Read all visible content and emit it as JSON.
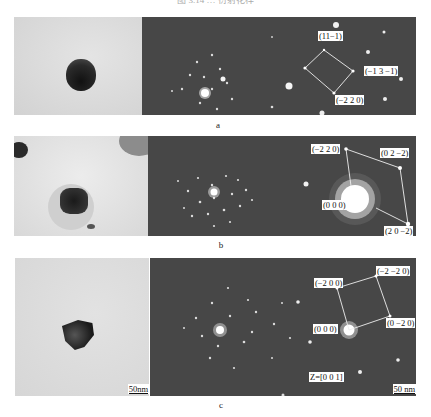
{
  "header": {
    "text": "图 3.14 … 衍射花样"
  },
  "panels": [
    {
      "caption": "a",
      "bright_field": {
        "particle": "rounded dark particle",
        "background": "#dcdcdc"
      },
      "diffraction": {
        "background": "#474747",
        "labels": [
          "(11−1)",
          "(−1 3 −1)",
          "(−2 2 0)"
        ]
      }
    },
    {
      "caption": "b",
      "bright_field": {
        "particle": "rectangular dark particle with halo",
        "background": "#e2e2e2"
      },
      "diffraction": {
        "background": "#474747",
        "labels": [
          "(−2 2 0)",
          "(0 2 −2)",
          "(0 0 0)",
          "(2 0 −2)"
        ]
      }
    },
    {
      "caption": "c",
      "bright_field": {
        "particle": "faceted dark particle",
        "background": "#dedede",
        "scale_bar": "50nm"
      },
      "diffraction": {
        "background": "#474747",
        "labels": [
          "(−2 0 0)",
          "(−2 −2 0)",
          "(0 0 0)",
          "(0 −2 0)"
        ],
        "zone_axis": "Z=[0 0 1]",
        "scale_bar": "50 nm"
      }
    }
  ]
}
